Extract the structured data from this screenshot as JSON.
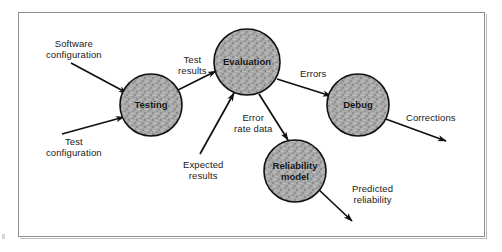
{
  "figure": {
    "background_color": "#ffffff",
    "frame_color": "#8e8e8e",
    "node_fill_color": "#a8a8a8",
    "node_stroke_color": "#111111",
    "arrow_color": "#111111"
  },
  "nodes": [
    {
      "id": "testing",
      "label": "Testing",
      "cx": 151,
      "cy": 105,
      "r": 31
    },
    {
      "id": "evaluation",
      "label": "Evaluation",
      "cx": 247,
      "cy": 62,
      "r": 33
    },
    {
      "id": "debug",
      "label": "Debug",
      "cx": 358,
      "cy": 105,
      "r": 31
    },
    {
      "id": "reliability",
      "label": "Reliability\nmodel",
      "cx": 295,
      "cy": 171,
      "r": 31
    }
  ],
  "edge_labels": [
    {
      "id": "software-configuration",
      "text": "Software\nconfiguration",
      "x": 46,
      "y": 38
    },
    {
      "id": "test-configuration",
      "text": "Test\nconfiguration",
      "x": 46,
      "y": 136
    },
    {
      "id": "test-results",
      "text": "Test\nresults",
      "x": 178,
      "y": 54
    },
    {
      "id": "errors",
      "text": "Errors",
      "x": 300,
      "y": 68
    },
    {
      "id": "corrections",
      "text": "Corrections",
      "x": 406,
      "y": 112
    },
    {
      "id": "expected-results",
      "text": "Expected\nresults",
      "x": 183,
      "y": 159
    },
    {
      "id": "error-rate-data",
      "text": "Error\nrate data",
      "x": 234,
      "y": 112
    },
    {
      "id": "predicted-reliability",
      "text": "Predicted\nreliability",
      "x": 352,
      "y": 183
    }
  ],
  "arrows": [
    {
      "id": "software-configuration-to-testing",
      "from": "Software configuration",
      "to": "Testing",
      "x1": 71,
      "y1": 63,
      "x2": 127,
      "y2": 93
    },
    {
      "id": "test-configuration-to-testing",
      "from": "Test configuration",
      "to": "Testing",
      "x1": 62,
      "y1": 134,
      "x2": 124,
      "y2": 117
    },
    {
      "id": "testing-to-evaluation",
      "from": "Testing",
      "to": "Evaluation",
      "x1": 172,
      "y1": 93,
      "x2": 216,
      "y2": 71
    },
    {
      "id": "evaluation-to-debug",
      "from": "Evaluation",
      "to": "Debug",
      "x1": 277,
      "y1": 79,
      "x2": 331,
      "y2": 96
    },
    {
      "id": "debug-to-corrections",
      "from": "Debug",
      "to": "Corrections",
      "x1": 383,
      "y1": 118,
      "x2": 446,
      "y2": 141
    },
    {
      "id": "expected-results-to-evaluation",
      "from": "Expected results",
      "to": "Evaluation",
      "x1": 200,
      "y1": 154,
      "x2": 234,
      "y2": 93
    },
    {
      "id": "evaluation-to-reliability",
      "from": "Evaluation",
      "to": "Reliability model",
      "x1": 259,
      "y1": 94,
      "x2": 288,
      "y2": 140
    },
    {
      "id": "reliability-to-predicted",
      "from": "Reliability model",
      "to": "Predicted reliability",
      "x1": 317,
      "y1": 188,
      "x2": 352,
      "y2": 221
    }
  ]
}
